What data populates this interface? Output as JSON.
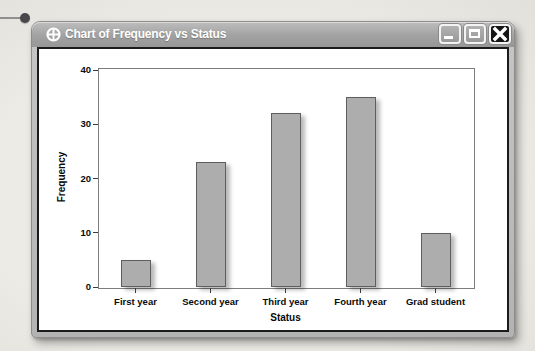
{
  "window": {
    "title": "Chart of Frequency vs Status",
    "icon": "crosshair-globe-icon",
    "buttons": [
      {
        "name": "minimize",
        "icon": "minimize-icon"
      },
      {
        "name": "maximize",
        "icon": "maximize-icon"
      },
      {
        "name": "close",
        "icon": "close-icon"
      }
    ]
  },
  "chart_data": {
    "type": "bar",
    "title": "Chart of Frequency vs Status",
    "categories": [
      "First year",
      "Second year",
      "Third year",
      "Fourth year",
      "Grad student"
    ],
    "values": [
      5,
      23,
      32,
      35,
      10
    ],
    "xlabel": "Status",
    "ylabel": "Frequency",
    "ylim": [
      0,
      40
    ],
    "yticks": [
      0,
      10,
      20,
      30,
      40
    ],
    "grid": false,
    "legend": false,
    "bar_fill": "#adadad",
    "bar_border": "#5e5e5e"
  },
  "colors": {
    "titlebar": "#a2a2a2",
    "title_text": "#ffffff",
    "window_frame": "#b9b9b9",
    "content_border": "#1b1b1b",
    "plot_border": "#7d7d7d",
    "close_button": "#141414",
    "page_background": "#eae8e3",
    "callout_dot": "#48484c"
  }
}
